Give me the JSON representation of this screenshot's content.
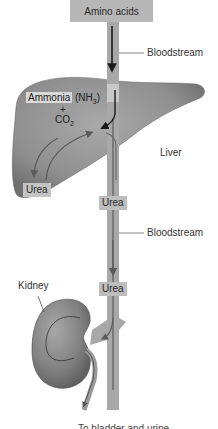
{
  "diagram": {
    "source_box": {
      "label": "Amino acids"
    },
    "labels": {
      "bloodstream_top": "Bloodstream",
      "ammonia": "Ammonia",
      "ammonia_formula": "(NH",
      "ammonia_sub": "3",
      "ammonia_close": ")",
      "plus": "+",
      "co2": "CO",
      "co2_sub": "2",
      "liver": "Liver",
      "urea_liver": "Urea",
      "urea_vessel_1": "Urea",
      "bloodstream_bottom": "Bloodstream",
      "urea_vessel_2": "Urea",
      "kidney": "Kidney",
      "bottom_truncated": "To bladder and urine"
    },
    "nodes": [
      "Amino acids",
      "Liver",
      "Kidney"
    ],
    "flows": [
      {
        "from": "Amino acids",
        "to": "Liver",
        "via": "Bloodstream"
      },
      {
        "from": "Ammonia (NH3) + CO2",
        "to": "Urea",
        "within": "Liver"
      },
      {
        "from": "Liver",
        "to": "Kidney",
        "carrying": "Urea",
        "via": "Bloodstream"
      }
    ],
    "colors": {
      "box_fill": "#b7b7b7",
      "vessel": "#a8a8a8",
      "organ": "#8f8f8f",
      "arrow": "#222222"
    }
  }
}
